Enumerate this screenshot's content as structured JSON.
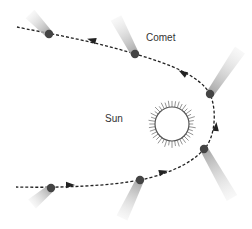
{
  "diagram": {
    "labels": {
      "sun": "Sun",
      "comet": "Comet"
    },
    "colors": {
      "background": "#ffffff",
      "path": "#222222",
      "nucleus": "#444444",
      "tail": "#bdbdbd",
      "sun_outline": "#555555",
      "sun_rays": "#888888",
      "text": "#333333"
    },
    "sun": {
      "cx": 172,
      "cy": 124,
      "r": 17,
      "ray_length": 7
    },
    "path_d": "M17,27 C40,32 90,40 135,54 C170,64 200,76 210,94 C218,112 214,140 204,149 C190,166 160,176 140,180 C110,186 60,188 16,187",
    "comets": [
      {
        "name": "comet-top-left",
        "nx": 49,
        "ny": 34,
        "tx": 30,
        "ty": 14
      },
      {
        "name": "comet-top-center",
        "nx": 135,
        "ny": 54,
        "tx": 116,
        "ty": 18
      },
      {
        "name": "comet-right-upper",
        "nx": 210,
        "ny": 94,
        "tx": 240,
        "ty": 50
      },
      {
        "name": "comet-right-lower",
        "nx": 204,
        "ny": 149,
        "tx": 232,
        "ty": 198
      },
      {
        "name": "comet-bottom-center",
        "nx": 140,
        "ny": 180,
        "tx": 122,
        "ty": 218
      },
      {
        "name": "comet-bottom-left",
        "nx": 51,
        "ny": 188,
        "tx": 32,
        "ty": 204
      }
    ],
    "arrows": [
      {
        "name": "arrow-top",
        "x": 92,
        "y": 40,
        "angle": 195
      },
      {
        "name": "arrow-upper-right",
        "x": 183,
        "y": 73,
        "angle": 210
      },
      {
        "name": "arrow-right",
        "x": 216,
        "y": 127,
        "angle": 275
      },
      {
        "name": "arrow-lower-right",
        "x": 163,
        "y": 172,
        "angle": -15
      },
      {
        "name": "arrow-bottom",
        "x": 70,
        "y": 185,
        "angle": 0
      }
    ]
  }
}
